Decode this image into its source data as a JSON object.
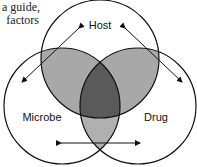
{
  "caption": {
    "line1": "a guide,",
    "line2": "factors"
  },
  "diagram": {
    "type": "venn",
    "circles": [
      {
        "label": "Host"
      },
      {
        "label": "Microbe"
      },
      {
        "label": "Drug"
      }
    ],
    "colors": {
      "pair_overlap": "#a8a8a8",
      "triple_overlap": "#5a5a5a",
      "outline": "#111111"
    },
    "arrows": [
      {
        "name": "host-microbe-arrow"
      },
      {
        "name": "host-drug-arrow"
      },
      {
        "name": "microbe-drug-arrow"
      }
    ]
  }
}
